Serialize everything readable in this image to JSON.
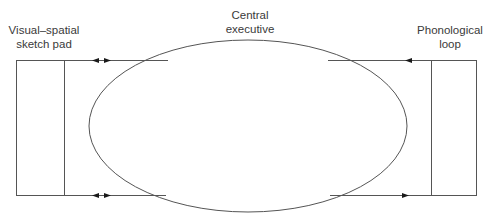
{
  "diagram": {
    "components": {
      "left": {
        "label_line1": "Visual–spatial",
        "label_line2": "sketch pad"
      },
      "center": {
        "label_line1": "Central",
        "label_line2": "executive"
      },
      "right": {
        "label_line1": "Phonological",
        "label_line2": "loop"
      }
    },
    "connections": [
      {
        "from": "visual-spatial sketch pad",
        "to": "central executive",
        "direction": "bidirectional",
        "position": "top"
      },
      {
        "from": "visual-spatial sketch pad",
        "to": "central executive",
        "direction": "bidirectional",
        "position": "bottom"
      },
      {
        "from": "phonological loop",
        "to": "central executive",
        "direction": "toward-center",
        "position": "top"
      },
      {
        "from": "central executive",
        "to": "phonological loop",
        "direction": "toward-loop",
        "position": "bottom"
      }
    ],
    "colors": {
      "stroke": "#555555",
      "arrow": "#1a1a1a",
      "text": "#3a3a3a",
      "background": "#ffffff"
    }
  }
}
